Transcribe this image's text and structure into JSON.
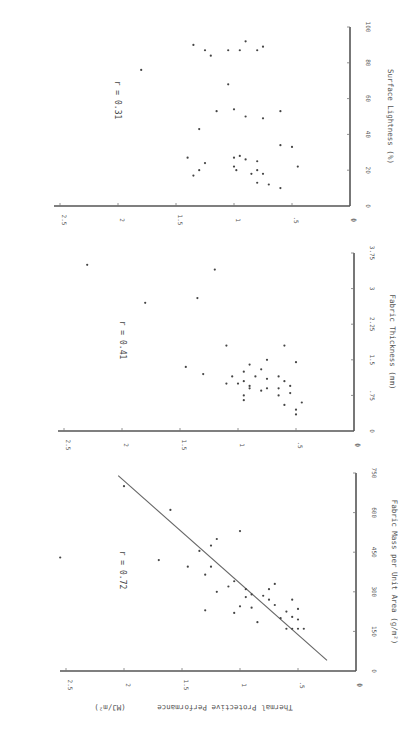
{
  "figure": {
    "orientation": "rotated 90 degrees clockwise",
    "shared_ylabel": "Thermal Protective Performance",
    "shared_ylabel_units": "(MJ/m²)"
  },
  "chart_data": [
    {
      "type": "scatter",
      "panel": "bottom",
      "title": "",
      "xlabel": "Fabric Mass per Unit Area  (g/m²)",
      "ylabel": "Thermal Protective Performance (MJ/m²)",
      "xticks": [
        "0",
        "150",
        "300",
        "450",
        "600",
        "750"
      ],
      "yticks": [
        "0",
        ".5",
        "1",
        "1.5",
        "2",
        "2.5"
      ],
      "xlim": [
        0,
        750
      ],
      "ylim": [
        0,
        2.5
      ],
      "annotation": "r = 0.72",
      "fit_line": {
        "x": [
          40,
          740
        ],
        "y": [
          0.25,
          2.05
        ]
      },
      "points": [
        [
          700,
          2.0
        ],
        [
          430,
          2.55
        ],
        [
          610,
          1.6
        ],
        [
          530,
          1.0
        ],
        [
          395,
          1.45
        ],
        [
          395,
          1.25
        ],
        [
          320,
          1.1
        ],
        [
          300,
          1.2
        ],
        [
          365,
          1.3
        ],
        [
          310,
          0.95
        ],
        [
          290,
          0.9
        ],
        [
          245,
          1.0
        ],
        [
          285,
          0.8
        ],
        [
          270,
          0.75
        ],
        [
          250,
          0.7
        ],
        [
          225,
          0.6
        ],
        [
          205,
          0.55
        ],
        [
          195,
          0.5
        ],
        [
          200,
          0.65
        ],
        [
          185,
          0.85
        ],
        [
          240,
          0.9
        ],
        [
          235,
          0.5
        ],
        [
          270,
          0.55
        ],
        [
          310,
          0.75
        ],
        [
          330,
          0.7
        ],
        [
          280,
          0.95
        ],
        [
          230,
          1.3
        ],
        [
          420,
          1.7
        ],
        [
          475,
          1.25
        ],
        [
          500,
          1.2
        ],
        [
          455,
          1.35
        ],
        [
          160,
          0.45
        ],
        [
          160,
          0.5
        ],
        [
          160,
          0.55
        ],
        [
          160,
          0.6
        ],
        [
          220,
          1.05
        ],
        [
          340,
          1.05
        ]
      ]
    },
    {
      "type": "scatter",
      "panel": "middle",
      "title": "",
      "xlabel": "Fabric Thickness  (mm)",
      "ylabel": "Thermal Protective Performance (MJ/m²)",
      "xticks": [
        "0",
        ".75",
        "1.5",
        "2.25",
        "3",
        "3.75"
      ],
      "yticks": [
        "0",
        ".5",
        "1",
        "1.5",
        "2",
        "2.5"
      ],
      "xlim": [
        0,
        3.75
      ],
      "ylim": [
        0,
        2.5
      ],
      "annotation": "r = 0.41",
      "points": [
        [
          3.5,
          2.3
        ],
        [
          2.7,
          1.8
        ],
        [
          2.8,
          1.35
        ],
        [
          1.8,
          1.1
        ],
        [
          3.4,
          1.2
        ],
        [
          1.5,
          0.75
        ],
        [
          1.8,
          0.6
        ],
        [
          1.45,
          0.5
        ],
        [
          1.3,
          0.8
        ],
        [
          1.2,
          1.3
        ],
        [
          1.35,
          1.45
        ],
        [
          1.15,
          1.05
        ],
        [
          1.05,
          0.95
        ],
        [
          0.95,
          0.9
        ],
        [
          1.15,
          0.85
        ],
        [
          1.0,
          1.0
        ],
        [
          0.85,
          0.8
        ],
        [
          0.9,
          0.75
        ],
        [
          0.9,
          0.9
        ],
        [
          0.8,
          0.55
        ],
        [
          0.75,
          0.65
        ],
        [
          0.9,
          0.65
        ],
        [
          1.1,
          0.75
        ],
        [
          1.15,
          0.65
        ],
        [
          1.4,
          0.9
        ],
        [
          1.25,
          0.95
        ],
        [
          0.95,
          0.55
        ],
        [
          1.05,
          0.6
        ],
        [
          0.45,
          0.5
        ],
        [
          0.35,
          0.5
        ],
        [
          0.55,
          0.6
        ],
        [
          0.65,
          0.95
        ],
        [
          0.6,
          0.45
        ],
        [
          1.0,
          1.1
        ],
        [
          0.75,
          0.95
        ]
      ]
    },
    {
      "type": "scatter",
      "panel": "top",
      "title": "",
      "xlabel": "Surface Lightness  (%)",
      "ylabel": "Thermal Protective Performance (MJ/m²)",
      "xticks": [
        "0",
        "20",
        "40",
        "60",
        "80",
        "100"
      ],
      "yticks": [
        "0",
        ".5",
        "1",
        "1.5",
        "2",
        "2.5"
      ],
      "xlim": [
        0,
        100
      ],
      "ylim": [
        0,
        2.5
      ],
      "annotation": "r = 0.31",
      "points": [
        [
          76,
          1.8
        ],
        [
          90,
          1.35
        ],
        [
          87,
          1.25
        ],
        [
          87,
          1.05
        ],
        [
          87,
          0.95
        ],
        [
          87,
          0.8
        ],
        [
          92,
          0.9
        ],
        [
          89,
          0.75
        ],
        [
          84,
          1.2
        ],
        [
          68,
          1.05
        ],
        [
          53,
          1.15
        ],
        [
          54,
          1.0
        ],
        [
          50,
          0.9
        ],
        [
          49,
          0.75
        ],
        [
          53,
          0.6
        ],
        [
          33,
          0.5
        ],
        [
          34,
          0.6
        ],
        [
          22,
          0.45
        ],
        [
          27,
          1.4
        ],
        [
          24,
          1.25
        ],
        [
          17,
          1.35
        ],
        [
          20,
          1.3
        ],
        [
          20,
          0.98
        ],
        [
          18,
          0.85
        ],
        [
          28,
          0.95
        ],
        [
          26,
          0.9
        ],
        [
          25,
          0.8
        ],
        [
          20,
          0.8
        ],
        [
          18,
          0.75
        ],
        [
          12,
          0.7
        ],
        [
          13,
          0.8
        ],
        [
          10,
          0.6
        ],
        [
          22,
          1.0
        ],
        [
          27,
          1.0
        ],
        [
          43,
          1.3
        ]
      ]
    }
  ]
}
